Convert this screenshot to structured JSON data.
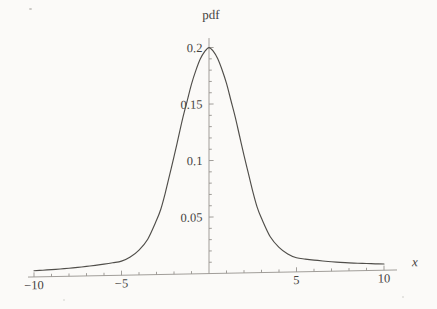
{
  "page": {
    "background": "#fbfaf8"
  },
  "chart_data": {
    "type": "line",
    "title": "",
    "ylabel": "pdf",
    "xlabel": "x",
    "xlim": [
      -10,
      10
    ],
    "ylim": [
      0,
      0.2
    ],
    "grid": false,
    "legend": "none",
    "x_major_ticks": [
      {
        "value": -10,
        "label": "−10"
      },
      {
        "value": -5,
        "label": "−5"
      },
      {
        "value": 5,
        "label": "5"
      },
      {
        "value": 10,
        "label": "10"
      }
    ],
    "x_minor_tick_step": 1,
    "y_major_ticks": [
      {
        "value": 0.05,
        "label": "0.05"
      },
      {
        "value": 0.1,
        "label": "0.1"
      },
      {
        "value": 0.15,
        "label": "0.15"
      },
      {
        "value": 0.2,
        "label": "0.2"
      }
    ],
    "y_minor_tick_step": 0.01,
    "peak": {
      "x": 0,
      "pdf": 0.2
    },
    "colors": {
      "axis": "#97948f",
      "curve": "#504e4a",
      "text": "#45433f"
    },
    "series": [
      {
        "name": "pdf",
        "points": [
          [
            -10,
            0.0055
          ],
          [
            -9.5,
            0.0058
          ],
          [
            -9,
            0.0062
          ],
          [
            -8.5,
            0.0066
          ],
          [
            -8,
            0.0071
          ],
          [
            -7.5,
            0.0077
          ],
          [
            -7,
            0.0084
          ],
          [
            -6.5,
            0.0092
          ],
          [
            -6,
            0.0101
          ],
          [
            -5.5,
            0.0112
          ],
          [
            -5,
            0.0125
          ],
          [
            -4.5,
            0.016
          ],
          [
            -4,
            0.022
          ],
          [
            -3.5,
            0.0315
          ],
          [
            -3,
            0.048
          ],
          [
            -2.75,
            0.058
          ],
          [
            -2.5,
            0.072
          ],
          [
            -2.25,
            0.088
          ],
          [
            -2,
            0.104
          ],
          [
            -1.75,
            0.121
          ],
          [
            -1.5,
            0.138
          ],
          [
            -1.25,
            0.153
          ],
          [
            -1,
            0.168
          ],
          [
            -0.75,
            0.18
          ],
          [
            -0.5,
            0.19
          ],
          [
            -0.25,
            0.1965
          ],
          [
            0,
            0.2
          ],
          [
            0.25,
            0.1965
          ],
          [
            0.5,
            0.19
          ],
          [
            0.75,
            0.18
          ],
          [
            1,
            0.168
          ],
          [
            1.25,
            0.153
          ],
          [
            1.5,
            0.138
          ],
          [
            1.75,
            0.121
          ],
          [
            2,
            0.104
          ],
          [
            2.25,
            0.088
          ],
          [
            2.5,
            0.072
          ],
          [
            2.75,
            0.058
          ],
          [
            3,
            0.048
          ],
          [
            3.5,
            0.0315
          ],
          [
            4,
            0.022
          ],
          [
            4.5,
            0.016
          ],
          [
            5,
            0.0125
          ],
          [
            5.5,
            0.0112
          ],
          [
            6,
            0.0101
          ],
          [
            6.5,
            0.0092
          ],
          [
            7,
            0.0084
          ],
          [
            7.5,
            0.0077
          ],
          [
            8,
            0.0071
          ],
          [
            8.5,
            0.0066
          ],
          [
            9,
            0.0062
          ],
          [
            9.5,
            0.0058
          ],
          [
            10,
            0.0055
          ]
        ]
      }
    ]
  }
}
